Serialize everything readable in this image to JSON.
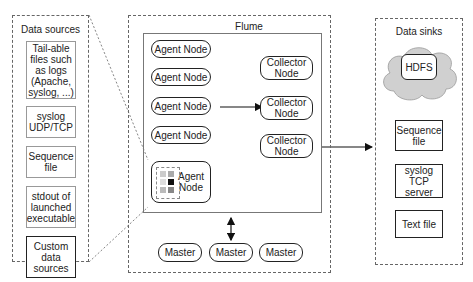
{
  "data_sources": {
    "title": "Data sources",
    "items": [
      {
        "label": "Tail-able files such as logs (Apache, syslog, ...)"
      },
      {
        "label": "syslog UDP/TCP"
      },
      {
        "label": "Sequence file"
      },
      {
        "label": "stdout of launched executable"
      },
      {
        "label": "Custom data sources"
      }
    ]
  },
  "flume": {
    "title": "Flume",
    "agent_nodes": [
      {
        "label": "Agent Node"
      },
      {
        "label": "Agent Node"
      },
      {
        "label": "Agent Node"
      },
      {
        "label": "Agent Node"
      },
      {
        "label": "Agent Node"
      }
    ],
    "collector_nodes": [
      {
        "label": "Collector Node"
      },
      {
        "label": "Collector Node"
      },
      {
        "label": "Collector Node"
      }
    ],
    "masters": [
      {
        "label": "Master"
      },
      {
        "label": "Master"
      },
      {
        "label": "Master"
      }
    ]
  },
  "data_sinks": {
    "title": "Data sinks",
    "hdfs": {
      "label": "HDFS"
    },
    "items": [
      {
        "label": "Sequence file"
      },
      {
        "label": "syslog TCP server"
      },
      {
        "label": "Text file"
      }
    ]
  }
}
